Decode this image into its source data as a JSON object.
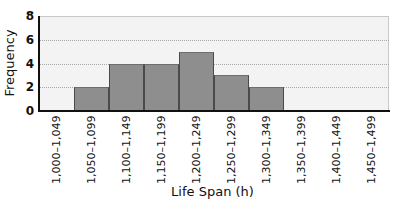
{
  "chart_data": {
    "type": "bar",
    "subtype": "histogram",
    "title": "",
    "xlabel": "Life Span (h)",
    "ylabel": "Frequency",
    "categories": [
      "1,000–1,049",
      "1,050–1,099",
      "1,100–1,149",
      "1,150–1,199",
      "1,200–1,249",
      "1,250–1,299",
      "1,300–1,349",
      "1,350–1,399",
      "1,400–1,449",
      "1,450–1,499"
    ],
    "values": [
      0,
      2,
      4,
      4,
      5,
      3,
      2,
      0,
      0,
      0
    ],
    "ylim": [
      0,
      8
    ],
    "yticks": [
      0,
      2,
      4,
      6,
      8
    ],
    "grid": "horizontal dotted",
    "legend": "none",
    "colors": {
      "bar": "#8e8e8e",
      "plot_background": "#f3f3f3",
      "axis": "#111111"
    }
  }
}
